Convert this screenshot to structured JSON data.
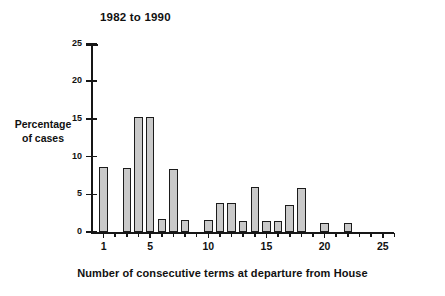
{
  "chart_data": {
    "type": "bar",
    "title": "1982 to 1990",
    "xlabel": "Number of consecutive terms at departure from House",
    "ylabel": "Percentage of cases",
    "ylabel_lines": [
      "Percentage",
      "of cases"
    ],
    "categories": [
      1,
      2,
      3,
      4,
      5,
      6,
      7,
      8,
      9,
      10,
      11,
      12,
      13,
      14,
      15,
      16,
      17,
      18,
      19,
      20,
      21,
      22,
      23,
      24,
      25
    ],
    "values": [
      8.6,
      0,
      8.5,
      15.2,
      15.2,
      1.7,
      8.4,
      1.6,
      0,
      1.6,
      3.8,
      3.8,
      1.5,
      6.0,
      1.4,
      1.4,
      3.6,
      5.9,
      0,
      1.2,
      0,
      1.2,
      0,
      0,
      0
    ],
    "xlim": [
      0,
      26
    ],
    "ylim": [
      0,
      25
    ],
    "ytick_values": [
      0,
      5,
      10,
      15,
      20,
      25
    ],
    "ytick_labels": [
      "0",
      "5",
      "10",
      "15",
      "20",
      "25"
    ],
    "xtick_values": [
      1,
      5,
      10,
      15,
      20,
      25
    ],
    "xtick_labels": [
      "1",
      "5",
      "10",
      "15",
      "20",
      "25"
    ],
    "xtick_minor_values": [
      2,
      3,
      4,
      6,
      7,
      8,
      9,
      11,
      12,
      13,
      14,
      16,
      17,
      18,
      19,
      21,
      22,
      23,
      24,
      26
    ],
    "grid": false,
    "legend": null,
    "bar_fill_color": "#c9c9c9",
    "bar_border_color": "#1b1b1b",
    "axis_color": "#161616",
    "background_color": "#ffffff"
  }
}
